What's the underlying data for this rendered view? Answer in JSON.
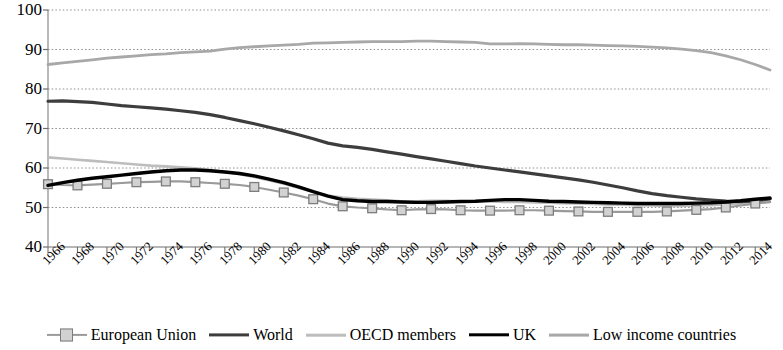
{
  "chart_data": {
    "type": "line",
    "title": "",
    "xlabel": "",
    "ylabel": "",
    "ylim": [
      40,
      100
    ],
    "ytick_step": 10,
    "yticks": [
      40,
      50,
      60,
      70,
      80,
      90,
      100
    ],
    "grid": true,
    "grid_style": "dotted-horizontal",
    "legend_position": "bottom",
    "xlim": [
      1966,
      2015
    ],
    "x": [
      1966,
      1967,
      1968,
      1969,
      1970,
      1971,
      1972,
      1973,
      1974,
      1975,
      1976,
      1977,
      1978,
      1979,
      1980,
      1981,
      1982,
      1983,
      1984,
      1985,
      1986,
      1987,
      1988,
      1989,
      1990,
      1991,
      1992,
      1993,
      1994,
      1995,
      1996,
      1997,
      1998,
      1999,
      2000,
      2001,
      2002,
      2003,
      2004,
      2005,
      2006,
      2007,
      2008,
      2009,
      2010,
      2011,
      2012,
      2013,
      2014,
      2015
    ],
    "xtick_labels": [
      "1966",
      "1968",
      "1970",
      "1972",
      "1974",
      "1976",
      "1978",
      "1980",
      "1982",
      "1984",
      "1986",
      "1988",
      "1990",
      "1992",
      "1994",
      "1996",
      "1998",
      "2000",
      "2002",
      "2004",
      "2006",
      "2008",
      "2010",
      "2012",
      "2014"
    ],
    "xtick_values": [
      1966,
      1968,
      1970,
      1972,
      1974,
      1976,
      1978,
      1980,
      1982,
      1984,
      1986,
      1988,
      1990,
      1992,
      1994,
      1996,
      1998,
      2000,
      2002,
      2004,
      2006,
      2008,
      2010,
      2012,
      2014
    ],
    "series": [
      {
        "name": "European Union",
        "color": "#9a9a9a",
        "width": 2.2,
        "marker": "square",
        "marker_face": "#d2d2d2",
        "marker_edge": "#7d7d7d",
        "values": [
          55.9,
          55.7,
          55.6,
          55.8,
          56.0,
          56.2,
          56.4,
          56.5,
          56.6,
          56.6,
          56.4,
          56.2,
          56.0,
          55.7,
          55.2,
          54.5,
          53.8,
          53.0,
          52.1,
          51.0,
          50.3,
          50.0,
          49.8,
          49.5,
          49.3,
          49.5,
          49.6,
          49.5,
          49.3,
          49.2,
          49.2,
          49.2,
          49.3,
          49.3,
          49.2,
          49.1,
          49.0,
          48.9,
          48.9,
          48.9,
          48.9,
          48.9,
          49.0,
          49.2,
          49.4,
          49.6,
          50.0,
          50.5,
          51.0,
          51.4
        ]
      },
      {
        "name": "World",
        "color": "#3d3d3d",
        "width": 3.2,
        "marker": "none",
        "values": [
          76.9,
          77.0,
          76.8,
          76.6,
          76.2,
          75.8,
          75.5,
          75.2,
          74.9,
          74.5,
          74.1,
          73.5,
          72.8,
          72.0,
          71.2,
          70.3,
          69.4,
          68.4,
          67.4,
          66.3,
          65.6,
          65.2,
          64.7,
          64.1,
          63.5,
          62.9,
          62.3,
          61.7,
          61.1,
          60.5,
          60.0,
          59.5,
          59.0,
          58.5,
          58.0,
          57.5,
          57.0,
          56.4,
          55.7,
          55.0,
          54.2,
          53.5,
          53.0,
          52.6,
          52.2,
          51.9,
          51.6,
          51.5,
          51.7,
          52.2
        ]
      },
      {
        "name": "OECD members",
        "color": "#bdbdbd",
        "width": 2.6,
        "marker": "none",
        "values": [
          62.7,
          62.4,
          62.1,
          61.8,
          61.5,
          61.2,
          60.9,
          60.6,
          60.4,
          60.2,
          59.9,
          59.5,
          59.0,
          58.4,
          57.7,
          56.9,
          56.0,
          55.0,
          54.0,
          53.0,
          52.5,
          52.2,
          52.0,
          51.8,
          51.6,
          51.6,
          51.7,
          51.7,
          51.6,
          51.5,
          51.5,
          51.4,
          51.4,
          51.3,
          51.2,
          51.1,
          51.0,
          50.9,
          50.8,
          50.7,
          50.6,
          50.5,
          50.4,
          50.4,
          50.5,
          50.6,
          50.8,
          51.0,
          51.2,
          51.4
        ]
      },
      {
        "name": "UK",
        "color": "#000000",
        "width": 3.4,
        "marker": "none",
        "values": [
          55.6,
          56.3,
          56.9,
          57.4,
          57.8,
          58.2,
          58.6,
          59.0,
          59.3,
          59.5,
          59.5,
          59.3,
          59.0,
          58.6,
          58.0,
          57.2,
          56.3,
          55.2,
          54.0,
          52.9,
          52.0,
          51.7,
          51.5,
          51.5,
          51.4,
          51.3,
          51.3,
          51.4,
          51.5,
          51.6,
          51.8,
          52.0,
          52.0,
          51.8,
          51.6,
          51.5,
          51.4,
          51.3,
          51.2,
          51.1,
          51.0,
          51.0,
          51.0,
          51.0,
          51.1,
          51.2,
          51.4,
          51.7,
          52.1,
          52.4
        ]
      },
      {
        "name": "Low income countries",
        "color": "#a8a8a8",
        "width": 2.8,
        "marker": "none",
        "values": [
          86.2,
          86.6,
          87.0,
          87.4,
          87.8,
          88.1,
          88.4,
          88.7,
          88.9,
          89.2,
          89.4,
          89.6,
          90.1,
          90.5,
          90.7,
          90.9,
          91.1,
          91.3,
          91.6,
          91.7,
          91.8,
          91.9,
          92.0,
          92.0,
          92.0,
          92.1,
          92.1,
          92.0,
          91.9,
          91.8,
          91.4,
          91.4,
          91.5,
          91.4,
          91.3,
          91.2,
          91.2,
          91.1,
          91.0,
          90.9,
          90.8,
          90.6,
          90.4,
          90.1,
          89.7,
          89.2,
          88.4,
          87.4,
          86.2,
          84.8
        ]
      }
    ]
  },
  "legend": {
    "items": [
      {
        "label": "European Union"
      },
      {
        "label": "World"
      },
      {
        "label": "OECD members"
      },
      {
        "label": "UK"
      },
      {
        "label": "Low income countries"
      }
    ]
  }
}
